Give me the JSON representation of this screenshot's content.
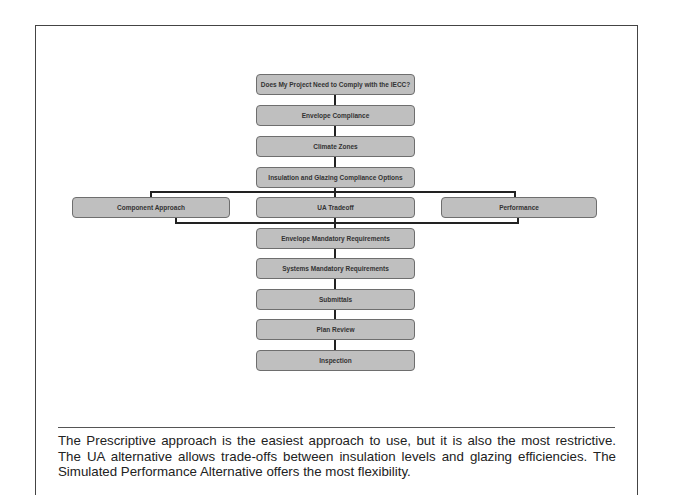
{
  "flowchart": {
    "steps": {
      "comply": "Does My Project Need to Comply with the IECC?",
      "envelope": "Envelope Compliance",
      "climate": "Climate Zones",
      "options": "Insulation and Glazing Compliance Options",
      "envelope_mandatory": "Envelope Mandatory Requirements",
      "systems_mandatory": "Systems Mandatory Requirements",
      "submittals": "Submittals",
      "plan_review": "Plan Review",
      "inspection": "Inspection"
    },
    "branches": {
      "component": "Component Approach",
      "ua": "UA Tradeoff",
      "performance": "Performance"
    },
    "colors": {
      "box_fill": "#bfbfbf",
      "box_border": "#6e6e6e",
      "connector": "#222222",
      "text": "#333333"
    }
  },
  "caption": {
    "text": "The Prescriptive approach is the easiest approach to use, but it is also the most restrictive. The UA alternative allows trade-offs between insulation levels and glazing efficiencies. The Simulated Performance Alternative offers the most flexibility."
  }
}
